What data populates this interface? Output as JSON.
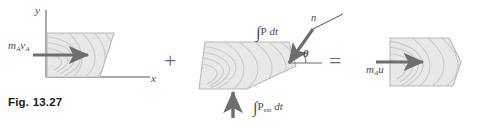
{
  "figure": {
    "caption": "Fig. 13.27",
    "equation_operators": {
      "plus": "+",
      "equals": "="
    }
  },
  "axes": {
    "y_label": "y",
    "x_label": "x",
    "color": "#a8a8a8"
  },
  "panels": {
    "left": {
      "name": "initial-momentum",
      "vector_label": {
        "m": "m",
        "m_sub": "A",
        "v": "v",
        "v_sub": "A"
      }
    },
    "middle": {
      "name": "impulse",
      "impulse_P": {
        "integral": "∫",
        "symbol": "P",
        "differential": "dt"
      },
      "impulse_Pext": {
        "integral": "∫",
        "symbol": "P",
        "symbol_sub": "ext",
        "differential": "dt"
      },
      "normal_label": "n",
      "angle_label": "θ"
    },
    "right": {
      "name": "final-momentum",
      "vector_label": {
        "m": "m",
        "m_sub": "A",
        "u": "u"
      }
    }
  },
  "colors": {
    "block_fill": "#e8e8e6",
    "block_stroke": "#b9b9b7",
    "grain_stroke": "#c9c9c7",
    "arrow": "#6e6e6e",
    "axis": "#a8a8a8",
    "text": "#3c3c3c",
    "caption": "#1a1a1a"
  }
}
